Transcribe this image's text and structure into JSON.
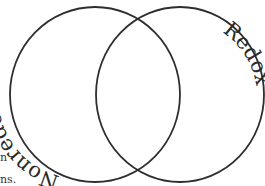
{
  "diagram": {
    "type": "venn",
    "sets": [
      {
        "label": "Nonredox",
        "side": "left"
      },
      {
        "label": "Redox",
        "side": "right"
      }
    ],
    "stroke_color": "#2e2e2e",
    "text_color": "#2a2a2a"
  },
  "cut_off_text": {
    "line1": "n",
    "line2": "ns."
  }
}
